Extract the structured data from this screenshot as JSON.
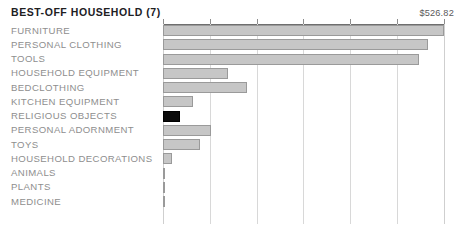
{
  "chart_data": {
    "type": "bar",
    "orientation": "horizontal",
    "title": "BEST-OFF HOUSEHOLD (7)",
    "xlabel": "",
    "ylabel": "",
    "xlim": [
      0,
      526.82
    ],
    "grid": true,
    "gridline_count": 6,
    "legend": "none",
    "max_value_label": "$526.82",
    "highlight_category": "RELIGIOUS OBJECTS",
    "categories": [
      "FURNITURE",
      "PERSONAL CLOTHING",
      "TOOLS",
      "HOUSEHOLD EQUIPMENT",
      "BEDCLOTHING",
      "KITCHEN EQUIPMENT",
      "RELIGIOUS OBJECTS",
      "PERSONAL ADORNMENT",
      "TOYS",
      "HOUSEHOLD DECORATIONS",
      "ANIMALS",
      "PLANTS",
      "MEDICINE"
    ],
    "values": [
      526.82,
      498.6,
      481.6,
      122.3,
      158.1,
      56.5,
      32.0,
      90.4,
      69.6,
      16.9,
      2.0,
      2.0,
      2.0
    ],
    "colors": {
      "bar_fill": "#c6c6c6",
      "bar_stroke": "#9a9a9a",
      "highlight_fill": "#0b0b0b",
      "gridline": "#d8d8d8",
      "axis": "#6e6e6e",
      "label_text": "#8e8e8e",
      "title_text": "#20201f",
      "value_text": "#5a5a5a",
      "background": "#ffffff"
    }
  }
}
